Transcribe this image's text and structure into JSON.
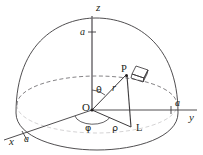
{
  "figure": {
    "kind": "spherical-coordinates-hemisphere-diagram",
    "width": 203,
    "height": 155,
    "background": "#ffffff",
    "stroke_color": "#3c3a3c",
    "text_color": "#231f20",
    "dashed_stroke": "#6f6d70"
  },
  "axes": {
    "z": {
      "label": "z",
      "x": 96,
      "y": 11
    },
    "y": {
      "label": "y",
      "x": 189,
      "y": 121
    },
    "x": {
      "label": "x",
      "x": 9,
      "y": 145
    }
  },
  "radius_markers": [
    {
      "name": "a-on-z-axis",
      "label": "a",
      "x": 80,
      "y": 35
    },
    {
      "name": "a-on-y-axis",
      "label": "a",
      "x": 175,
      "y": 106
    },
    {
      "name": "a-on-x-axis",
      "label": "a",
      "x": 24,
      "y": 142
    }
  ],
  "points": {
    "origin": {
      "label": "O",
      "x": 82,
      "y": 111
    },
    "p": {
      "label": "P",
      "x": 121,
      "y": 72
    },
    "l": {
      "label": "L",
      "x": 136,
      "y": 131
    }
  },
  "measures": {
    "theta": {
      "label": "θ",
      "x": 96,
      "y": 93
    },
    "phi": {
      "label": "φ",
      "x": 85,
      "y": 131
    },
    "rho": {
      "label": "ρ",
      "x": 112,
      "y": 131
    },
    "r": {
      "label": "r",
      "x": 112,
      "y": 91
    }
  },
  "elements": {
    "volume_element": {
      "name": "dV-box",
      "x": 131,
      "y": 66,
      "w": 18,
      "h": 14
    }
  }
}
